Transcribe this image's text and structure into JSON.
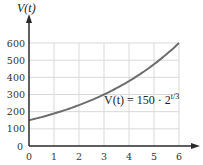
{
  "chart_data": {
    "type": "line",
    "title": "",
    "ylabel": "V(t)",
    "xlabel": "",
    "annotation": "V(t) = 150 · 2^(t/3)",
    "function": "150 * 2^(t/3)",
    "x": [
      0,
      1,
      2,
      3,
      4,
      5,
      6
    ],
    "series": [
      {
        "name": "V(t)",
        "values": [
          150,
          189,
          238,
          300,
          378,
          476,
          600
        ]
      }
    ],
    "xlim": [
      0,
      6
    ],
    "ylim": [
      0,
      600
    ],
    "x_ticks": [
      "0",
      "1",
      "2",
      "3",
      "4",
      "5",
      "6"
    ],
    "y_ticks": [
      "0",
      "100",
      "200",
      "300",
      "400",
      "500",
      "600"
    ],
    "grid": true,
    "legend": "none"
  },
  "labels": {
    "y_axis": "V(t)",
    "equation_main": "V(t) = 150 · 2",
    "equation_exp": "t/3"
  },
  "colors": {
    "curve": "#6e6e6e",
    "grid": "#d9d9d9",
    "axis": "#2a2a2a"
  }
}
